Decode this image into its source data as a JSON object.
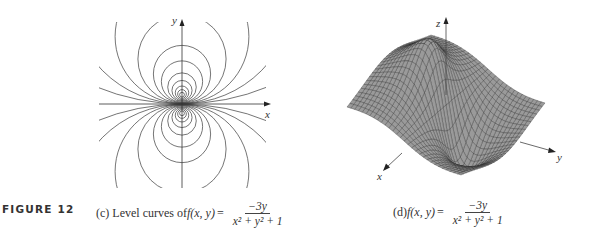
{
  "figure": {
    "label": "FIGURE 12",
    "function": {
      "name": "f(x, y)",
      "numerator": "−3y",
      "denominator": "x² + y² + 1",
      "equals": "="
    }
  },
  "panel_c": {
    "prefix": "(c) Level curves of ",
    "axes": {
      "x_label": "x",
      "y_label": "y"
    },
    "contour_levels": [
      -1.45,
      -1.35,
      -1.2,
      -1.0,
      -0.8,
      -0.6,
      -0.45,
      -0.3,
      -0.2,
      -0.12,
      -0.06,
      0.06,
      0.12,
      0.2,
      0.3,
      0.45,
      0.6,
      0.8,
      1.0,
      1.2,
      1.35,
      1.45
    ],
    "line_color": "#3a3a3a"
  },
  "panel_d": {
    "prefix": "(d) ",
    "axes": {
      "x_label": "x",
      "y_label": "y",
      "z_label": "z"
    },
    "surface_fill": "#9a9a9a",
    "mesh_color": "#2e2e2e"
  }
}
